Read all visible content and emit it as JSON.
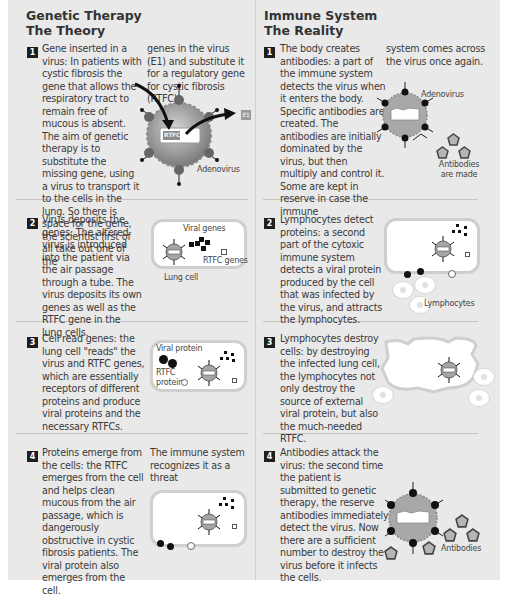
{
  "left": {
    "title_line1": "Genetic Therapy",
    "title_line2": "The Theory",
    "steps": [
      {
        "num": "1",
        "text": "Gene inserted in a virus: In patients with cystic fibrosis the gene that allows the respiratory tract to remain free of mucous is absent. The aim of genetic therapy is to substitute the missing gene, using a virus to transport it to the cells in the lung. So there is space for the gene, the scientist first of all take out one of the",
        "text_col2": "genes in the virus (E1) and substitute it for a regulatory gene for cystic fibrosis (RTFC).",
        "labels": {
          "adenovirus": "Adenovirus",
          "gene_tag": "RTFC",
          "e1": "E1"
        }
      },
      {
        "num": "2",
        "text": "Virus deposits the genes: The altered virus is introduced into the patient via the air passage through a tube. The virus deposits its own genes as well as the RTFC gene in the lung cells.",
        "labels": {
          "viral_genes": "Viral genes",
          "rtfc_genes": "RTFC genes",
          "lung_cell": "Lung cell"
        }
      },
      {
        "num": "3",
        "text": "Cell read genes: the lung cell \"reads\" the virus and RTFC genes, which are essentially receptors of different proteins and produce viral proteins and the necessary RTFCs.",
        "labels": {
          "viral_protein": "Viral protein",
          "rtfc": "RTFC",
          "protein": "protein"
        }
      },
      {
        "num": "4",
        "text": "Proteins emerge from the cells: the RTFC emerges from the cell and helps clean mucous from the air passage, which is dangerously obstructive in cystic fibrosis patients. The viral protein also emerges from the cell.",
        "text_col2": "The immune system recognizes it as a threat"
      }
    ]
  },
  "right": {
    "title_line1": "Immune System",
    "title_line2": "The Reality",
    "steps": [
      {
        "num": "1",
        "text": "The body creates antibodies: a part of the immune system detects the virus when it enters the body. Specific antibodies are created. The antibodies are initially dominated by the virus, but then multiply and control it. Some are kept in reserve in case the immune",
        "text_col2": "system comes across the virus once again.",
        "labels": {
          "adenovirus": "Adenovirus",
          "antibodies_l1": "Antibodies",
          "antibodies_l2": "are made"
        }
      },
      {
        "num": "2",
        "text": "Lymphocytes detect proteins: a second part of the cytoxic immune system detects a viral protein produced by the cell that was infected by the virus, and attracts the lymphocytes.",
        "labels": {
          "lymphocytes": "Lymphocytes"
        }
      },
      {
        "num": "3",
        "text": "Lymphocytes destroy cells: by destroying the infected lung cell, the lymphocytes not only destroy the source of external viral protein, but also the much-needed RTFC."
      },
      {
        "num": "4",
        "text": "Antibodies attack the virus: the second time the patient is submitted to genetic therapy, the reserve antibodies immediately detect the virus. Now there are a sufficient number to destroy the virus before it infects the cells.",
        "labels": {
          "antibodies": "Antibodies"
        }
      }
    ]
  },
  "colors": {
    "panel": "#e9e9e9",
    "divider": "#c4c4c4",
    "badge": "#1e1e1e",
    "virus_fill": "#9a9a9a"
  }
}
